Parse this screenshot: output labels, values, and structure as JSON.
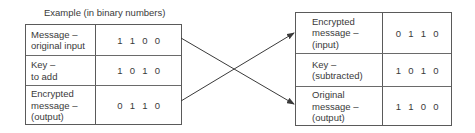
{
  "caption": "Example (in binary numbers)",
  "encrypt_table": {
    "rows": [
      {
        "label_lines": [
          "Message –",
          "original input"
        ],
        "bits": [
          "1",
          "1",
          "0",
          "0"
        ]
      },
      {
        "label_lines": [
          "Key –",
          "to add"
        ],
        "bits": [
          "1",
          "0",
          "1",
          "0"
        ]
      },
      {
        "label_lines": [
          "Encrypted",
          "message –",
          "(output)"
        ],
        "bits": [
          "0",
          "1",
          "1",
          "0"
        ]
      }
    ]
  },
  "decrypt_table": {
    "rows": [
      {
        "label_lines": [
          "Encrypted",
          "message –",
          "(input)"
        ],
        "bits": [
          "0",
          "1",
          "1",
          "0"
        ]
      },
      {
        "label_lines": [
          "Key –",
          "(subtracted)"
        ],
        "bits": [
          "1",
          "0",
          "1",
          "0"
        ]
      },
      {
        "label_lines": [
          "Original",
          "message –",
          "(output)"
        ],
        "bits": [
          "1",
          "1",
          "0",
          "0"
        ]
      }
    ]
  },
  "arrows": [
    {
      "from": "encrypt_table.rows.0",
      "to": "decrypt_table.rows.2",
      "meaning": "original message matches decrypted output"
    },
    {
      "from": "encrypt_table.rows.2",
      "to": "decrypt_table.rows.0",
      "meaning": "encrypted output becomes decryption input"
    }
  ],
  "colors": {
    "line": "#3a3a3a",
    "text": "#3a3a3a",
    "border": "#5a5a5a"
  }
}
